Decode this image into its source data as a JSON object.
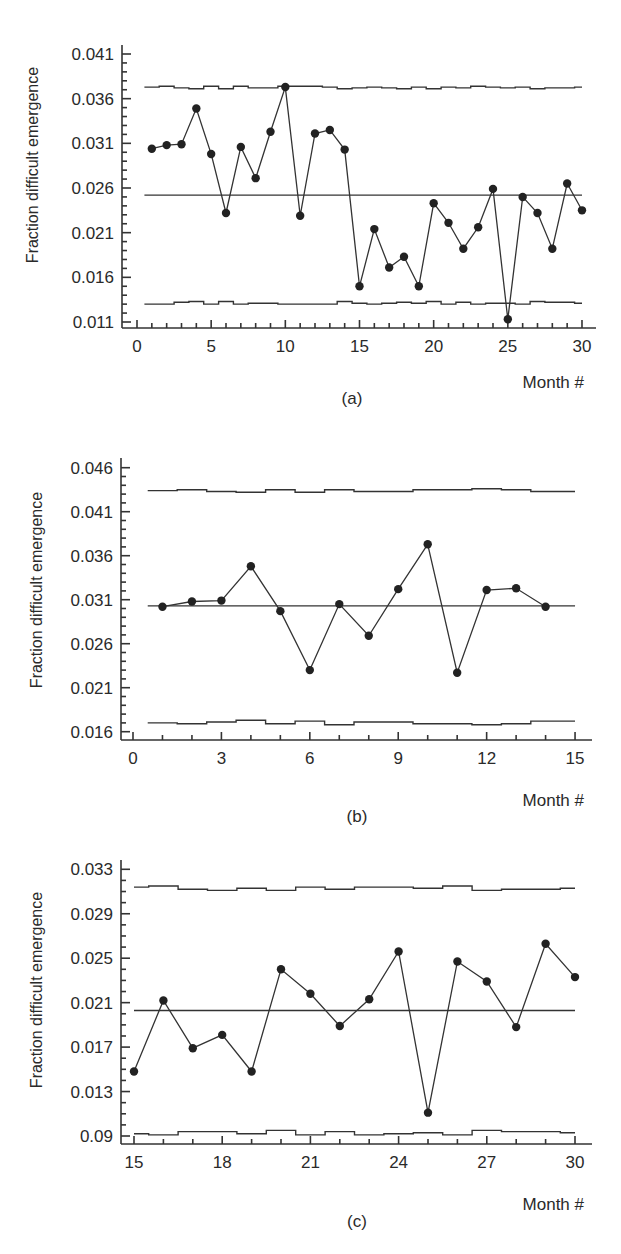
{
  "chart_data": [
    {
      "id": "a",
      "type": "line",
      "subtitle": "(a)",
      "xlabel": "Month #",
      "ylabel": "Fraction difficult emergence",
      "xlim": [
        0,
        30
      ],
      "ylim": [
        0.011,
        0.041
      ],
      "xticks": [
        0,
        5,
        10,
        15,
        20,
        25,
        30
      ],
      "xtick_labels": [
        "0",
        "5",
        "10",
        "15",
        "20",
        "25",
        "30"
      ],
      "yticks": [
        0.041,
        0.036,
        0.031,
        0.026,
        0.021,
        0.016,
        0.011
      ],
      "ytick_labels": [
        "0.041",
        "0.036",
        "0.031",
        "0.026",
        "0.021",
        "0.016",
        "0.011"
      ],
      "grid": false,
      "x": [
        1,
        2,
        3,
        4,
        5,
        6,
        7,
        8,
        9,
        10,
        11,
        12,
        13,
        14,
        15,
        16,
        17,
        18,
        19,
        20,
        21,
        22,
        23,
        24,
        25,
        26,
        27,
        28,
        29,
        30
      ],
      "series": [
        {
          "name": "Fraction difficult emergence",
          "values": [
            0.0304,
            0.0308,
            0.0309,
            0.0349,
            0.0298,
            0.0232,
            0.0306,
            0.0271,
            0.0323,
            0.0373,
            0.0229,
            0.0321,
            0.0325,
            0.0303,
            0.015,
            0.0214,
            0.0171,
            0.0183,
            0.015,
            0.0243,
            0.0221,
            0.0192,
            0.0216,
            0.0259,
            0.0113,
            0.025,
            0.0232,
            0.0192,
            0.0265,
            0.0235
          ]
        },
        {
          "name": "Center line",
          "values": [
            0.0252
          ]
        },
        {
          "name": "UCL",
          "values": [
            0.0373,
            0.0374,
            0.0372,
            0.0371,
            0.0374,
            0.0371,
            0.0374,
            0.0372,
            0.0372,
            0.0374,
            0.0374,
            0.0374,
            0.0373,
            0.0371,
            0.0372,
            0.0373,
            0.0372,
            0.0371,
            0.0373,
            0.0371,
            0.0373,
            0.0372,
            0.0374,
            0.0373,
            0.0372,
            0.0373,
            0.0371,
            0.0372,
            0.0372,
            0.0373
          ]
        },
        {
          "name": "LCL",
          "values": [
            0.013,
            0.013,
            0.0132,
            0.0133,
            0.013,
            0.0133,
            0.013,
            0.0131,
            0.0131,
            0.013,
            0.013,
            0.013,
            0.013,
            0.0133,
            0.0131,
            0.013,
            0.0131,
            0.0132,
            0.0131,
            0.0133,
            0.013,
            0.0132,
            0.013,
            0.0131,
            0.0131,
            0.013,
            0.0133,
            0.0132,
            0.0132,
            0.0131
          ]
        }
      ],
      "layout": {
        "axis_x": 122,
        "axis_top": 45,
        "axis_y": 328,
        "axis_right": 596,
        "x0_px": 137,
        "x0_val": 0,
        "px_per_x": 14.833,
        "y_top_px": 54,
        "y_top_val": 0.041,
        "y_bot_px": 322,
        "y_bot_val": 0.011,
        "minor_per_major": 5,
        "x_minor_step": 1,
        "xlabel_x": 584,
        "xlabel_y": 388,
        "caption_x": 352,
        "caption_y": 404,
        "ylabel_x": 38,
        "ylabel_y": 165
      }
    },
    {
      "id": "b",
      "type": "line",
      "subtitle": "(b)",
      "xlabel": "Month #",
      "ylabel": "Fraction difficult emergence",
      "xlim": [
        0,
        15
      ],
      "ylim": [
        0.016,
        0.046
      ],
      "xticks": [
        0,
        3,
        6,
        9,
        12,
        15
      ],
      "xtick_labels": [
        "0",
        "3",
        "6",
        "9",
        "12",
        "15"
      ],
      "yticks": [
        0.046,
        0.041,
        0.036,
        0.031,
        0.026,
        0.021,
        0.016
      ],
      "ytick_labels": [
        "0.046",
        "0.041",
        "0.036",
        "0.031",
        "0.026",
        "0.021",
        "0.016"
      ],
      "grid": false,
      "x": [
        1,
        2,
        3,
        4,
        5,
        6,
        7,
        8,
        9,
        10,
        11,
        12,
        13,
        14
      ],
      "series": [
        {
          "name": "Fraction difficult emergence",
          "values": [
            0.0302,
            0.0308,
            0.0309,
            0.0348,
            0.0297,
            0.023,
            0.0305,
            0.0269,
            0.0322,
            0.0373,
            0.0227,
            0.0321,
            0.0323,
            0.0302
          ]
        },
        {
          "name": "Center line",
          "values": [
            0.0303
          ]
        },
        {
          "name": "UCL",
          "values": [
            0.0434,
            0.0435,
            0.0433,
            0.0432,
            0.0435,
            0.0432,
            0.0435,
            0.0433,
            0.0433,
            0.0435,
            0.0435,
            0.0436,
            0.0435,
            0.0433,
            0.0433
          ]
        },
        {
          "name": "LCL",
          "values": [
            0.017,
            0.0169,
            0.0171,
            0.0173,
            0.0169,
            0.0172,
            0.0168,
            0.0171,
            0.0171,
            0.0169,
            0.0169,
            0.0168,
            0.0169,
            0.0172,
            0.0172
          ]
        }
      ],
      "layout": {
        "axis_x": 121,
        "axis_top": 458,
        "axis_y": 740,
        "axis_right": 592,
        "x0_px": 133,
        "x0_val": 0,
        "px_per_x": 29.47,
        "y_top_px": 467.7,
        "y_top_val": 0.046,
        "y_bot_px": 731.7,
        "y_bot_val": 0.016,
        "minor_per_major": 5,
        "x_minor_step": 1,
        "xlabel_x": 584,
        "xlabel_y": 806,
        "caption_x": 357,
        "caption_y": 822,
        "ylabel_x": 42,
        "ylabel_y": 590
      }
    },
    {
      "id": "c",
      "type": "line",
      "subtitle": "(c)",
      "xlabel": "Month #",
      "ylabel": "Fraction difficult emergence",
      "xlim": [
        15,
        30
      ],
      "ylim": [
        0.009,
        0.033
      ],
      "xticks": [
        15,
        18,
        21,
        24,
        27,
        30
      ],
      "xtick_labels": [
        "15",
        "18",
        "21",
        "24",
        "27",
        "30"
      ],
      "yticks": [
        0.033,
        0.029,
        0.025,
        0.021,
        0.017,
        0.013,
        0.009
      ],
      "ytick_labels": [
        "0.033",
        "0.029",
        "0.025",
        "0.021",
        "0.017",
        "0.013",
        "0.09"
      ],
      "grid": false,
      "x": [
        15,
        16,
        17,
        18,
        19,
        20,
        21,
        22,
        23,
        24,
        25,
        26,
        27,
        28,
        29,
        30
      ],
      "series": [
        {
          "name": "Fraction difficult emergence",
          "values": [
            0.0148,
            0.0212,
            0.0169,
            0.0181,
            0.0148,
            0.024,
            0.0218,
            0.0189,
            0.0213,
            0.0256,
            0.0111,
            0.0247,
            0.0229,
            0.0188,
            0.0263,
            0.0233
          ]
        },
        {
          "name": "Center line",
          "values": [
            0.0203
          ]
        },
        {
          "name": "UCL",
          "values": [
            0.0314,
            0.0315,
            0.0312,
            0.0311,
            0.0313,
            0.0311,
            0.0314,
            0.0312,
            0.0314,
            0.0314,
            0.0313,
            0.0315,
            0.0311,
            0.0312,
            0.0312,
            0.0313
          ]
        },
        {
          "name": "LCL",
          "values": [
            0.0092,
            0.0091,
            0.0094,
            0.0094,
            0.0092,
            0.0095,
            0.0091,
            0.0094,
            0.0091,
            0.0092,
            0.0093,
            0.0091,
            0.0095,
            0.0094,
            0.0094,
            0.0093
          ]
        }
      ],
      "layout": {
        "axis_x": 121,
        "axis_top": 860,
        "axis_y": 1144,
        "axis_right": 592,
        "x0_px": 134,
        "x0_val": 15,
        "px_per_x": 29.4,
        "y_top_px": 869.3,
        "y_top_val": 0.033,
        "y_bot_px": 1136,
        "y_bot_val": 0.009,
        "minor_per_major": 4,
        "x_minor_step": 1,
        "xlabel_x": 584,
        "xlabel_y": 1210,
        "caption_x": 357,
        "caption_y": 1227,
        "ylabel_x": 42,
        "ylabel_y": 990
      }
    }
  ],
  "colors": {
    "line": "#333333",
    "marker": "#222222",
    "text": "#2a2a2a",
    "background": "#ffffff"
  }
}
